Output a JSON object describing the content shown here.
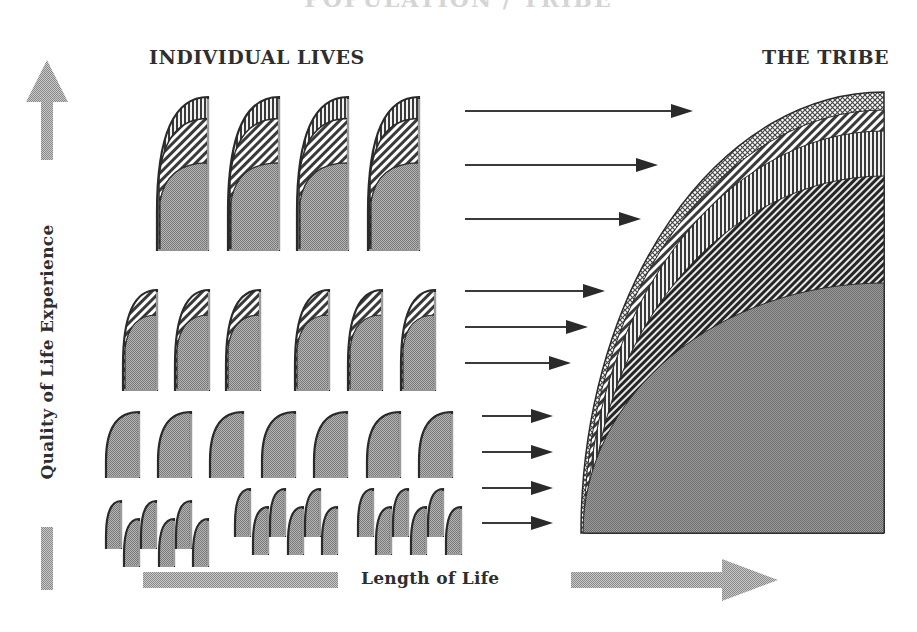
{
  "title": "POPULATION / TRIBE",
  "headers": {
    "individual_lives": "INDIVIDUAL LIVES",
    "the_tribe": "THE TRIBE"
  },
  "axes": {
    "y_label": "Quality of Life Experience",
    "x_label": "Length of Life"
  },
  "colors": {
    "background": "#ffffff",
    "fill_gray": "#9a9a9a",
    "fill_gray_dark": "#8c8c8c",
    "outline": "#2a2a2a",
    "arrow_line": "#3a3a3a",
    "axis_arrow": "#a8a8a8",
    "text": "#2e2e2e"
  },
  "axis_arrows": {
    "vertical": {
      "x_center": 47,
      "head_top": 60,
      "head_base": 102,
      "head_half_width": 21,
      "shaft_half_width": 6,
      "segments": [
        [
          102,
          160
        ],
        [
          527,
          590
        ]
      ]
    },
    "horizontal": {
      "y_center": 580,
      "shaft_half_width": 8,
      "segments": [
        [
          143,
          338
        ],
        [
          571,
          722
        ]
      ],
      "head_start": 722,
      "head_tip": 778,
      "head_half_width": 21
    }
  },
  "individual_lives": {
    "rows": [
      {
        "name": "four-band lives",
        "bands": 3,
        "shapes": [
          {
            "x": 157,
            "y": 97,
            "w": 51,
            "h": 153
          },
          {
            "x": 228,
            "y": 97,
            "w": 51,
            "h": 153
          },
          {
            "x": 297,
            "y": 97,
            "w": 51,
            "h": 153
          },
          {
            "x": 368,
            "y": 97,
            "w": 51,
            "h": 153
          }
        ],
        "band_fractions": [
          0.14,
          0.43
        ]
      },
      {
        "name": "two-band lives",
        "bands": 2,
        "shapes": [
          {
            "x": 123,
            "y": 290,
            "w": 34,
            "h": 100
          },
          {
            "x": 175,
            "y": 290,
            "w": 34,
            "h": 100
          },
          {
            "x": 226,
            "y": 290,
            "w": 34,
            "h": 100
          },
          {
            "x": 295,
            "y": 290,
            "w": 34,
            "h": 100
          },
          {
            "x": 348,
            "y": 290,
            "w": 34,
            "h": 100
          },
          {
            "x": 401,
            "y": 290,
            "w": 34,
            "h": 100
          }
        ],
        "band_fractions": [
          0.25
        ]
      },
      {
        "name": "single-band lives",
        "bands": 1,
        "shapes": [
          {
            "x": 106,
            "y": 412,
            "w": 33,
            "h": 65
          },
          {
            "x": 158,
            "y": 412,
            "w": 33,
            "h": 65
          },
          {
            "x": 210,
            "y": 412,
            "w": 33,
            "h": 65
          },
          {
            "x": 262,
            "y": 412,
            "w": 33,
            "h": 65
          },
          {
            "x": 314,
            "y": 412,
            "w": 33,
            "h": 65
          },
          {
            "x": 367,
            "y": 412,
            "w": 33,
            "h": 65
          },
          {
            "x": 419,
            "y": 412,
            "w": 33,
            "h": 65
          }
        ],
        "band_fractions": []
      },
      {
        "name": "short lives",
        "bands": 1,
        "shapes": [
          {
            "x": 106,
            "y": 501,
            "w": 15,
            "h": 47
          },
          {
            "x": 124,
            "y": 519,
            "w": 15,
            "h": 47
          },
          {
            "x": 141,
            "y": 501,
            "w": 15,
            "h": 47
          },
          {
            "x": 159,
            "y": 519,
            "w": 15,
            "h": 47
          },
          {
            "x": 176,
            "y": 501,
            "w": 15,
            "h": 47
          },
          {
            "x": 193,
            "y": 519,
            "w": 15,
            "h": 47
          },
          {
            "x": 235,
            "y": 489,
            "w": 15,
            "h": 47
          },
          {
            "x": 253,
            "y": 507,
            "w": 15,
            "h": 47
          },
          {
            "x": 270,
            "y": 489,
            "w": 15,
            "h": 47
          },
          {
            "x": 288,
            "y": 507,
            "w": 15,
            "h": 47
          },
          {
            "x": 305,
            "y": 489,
            "w": 15,
            "h": 47
          },
          {
            "x": 322,
            "y": 507,
            "w": 15,
            "h": 47
          },
          {
            "x": 358,
            "y": 489,
            "w": 15,
            "h": 47
          },
          {
            "x": 376,
            "y": 507,
            "w": 15,
            "h": 47
          },
          {
            "x": 393,
            "y": 489,
            "w": 15,
            "h": 47
          },
          {
            "x": 411,
            "y": 507,
            "w": 15,
            "h": 47
          },
          {
            "x": 428,
            "y": 489,
            "w": 15,
            "h": 47
          },
          {
            "x": 446,
            "y": 507,
            "w": 15,
            "h": 47
          }
        ],
        "band_fractions": []
      }
    ]
  },
  "flow_arrows": [
    {
      "x1": 465,
      "x2": 693,
      "y": 111
    },
    {
      "x1": 465,
      "x2": 658,
      "y": 165
    },
    {
      "x1": 465,
      "x2": 641,
      "y": 219
    },
    {
      "x1": 465,
      "x2": 605,
      "y": 291
    },
    {
      "x1": 465,
      "x2": 588,
      "y": 327
    },
    {
      "x1": 465,
      "x2": 571,
      "y": 363
    },
    {
      "x1": 482,
      "x2": 553,
      "y": 416
    },
    {
      "x1": 482,
      "x2": 553,
      "y": 452
    },
    {
      "x1": 482,
      "x2": 553,
      "y": 488
    },
    {
      "x1": 482,
      "x2": 553,
      "y": 523
    }
  ],
  "tribe": {
    "x": 581,
    "y": 92,
    "right": 884,
    "bottom": 533,
    "band_tops_at_right": [
      92,
      110,
      131,
      176,
      283
    ],
    "band_patterns": [
      "crosshatch",
      "diag-light",
      "vertical",
      "diag-dark",
      "solid"
    ]
  }
}
